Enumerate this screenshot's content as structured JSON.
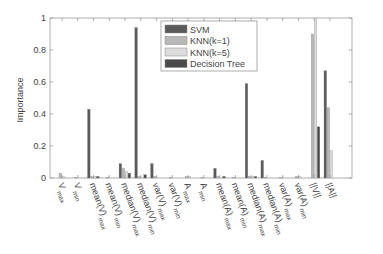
{
  "chart_data": {
    "type": "bar",
    "title": "",
    "xlabel": "",
    "ylabel": "Importance",
    "ylim": [
      0,
      1
    ],
    "yticks": [
      "0",
      "0.2",
      "0.4",
      "0.6",
      "0.8",
      "1"
    ],
    "grid": false,
    "legend_position": "upper right (inside)",
    "categories": [
      {
        "base": "V",
        "sub": "max"
      },
      {
        "base": "V",
        "sub": "min"
      },
      {
        "base": "mean(V)",
        "sub": "max"
      },
      {
        "base": "mean(V)",
        "sub": "min"
      },
      {
        "base": "median(V)",
        "sub": "max"
      },
      {
        "base": "median(V)",
        "sub": "min"
      },
      {
        "base": "var(V)",
        "sub": "max"
      },
      {
        "base": "var(V)",
        "sub": "min"
      },
      {
        "base": "A",
        "sub": "max"
      },
      {
        "base": "A",
        "sub": "min"
      },
      {
        "base": "mean(A)",
        "sub": "max"
      },
      {
        "base": "mean(A)",
        "sub": "min"
      },
      {
        "base": "median(A)",
        "sub": "max"
      },
      {
        "base": "median(A)",
        "sub": "min"
      },
      {
        "base": "var(A)",
        "sub": "max"
      },
      {
        "base": "var(A)",
        "sub": "min"
      },
      {
        "base": "||V||",
        "sub": ""
      },
      {
        "base": "||A||",
        "sub": ""
      }
    ],
    "series": [
      {
        "name": "SVM",
        "color": "#5a5a5a",
        "values": [
          0,
          0,
          0.43,
          0,
          0.09,
          0.94,
          0.09,
          0,
          0,
          0,
          0.06,
          0,
          0.59,
          0.11,
          0,
          0,
          0,
          0.67
        ]
      },
      {
        "name": "KNN(k=1)",
        "color": "#b8b8b8",
        "values": [
          0.03,
          0.005,
          0.01,
          0.005,
          0.06,
          0.01,
          0.01,
          0.005,
          0.01,
          0.005,
          0.01,
          0.005,
          0.01,
          0.005,
          0.005,
          0.01,
          0.9,
          0.44
        ]
      },
      {
        "name": "KNN(k=5)",
        "color": "#dcdcdc",
        "values": [
          0.01,
          0,
          0.01,
          0,
          0.04,
          0,
          0,
          0,
          0.01,
          0,
          0,
          0,
          0.01,
          0,
          0,
          0.01,
          1.0,
          0.17
        ]
      },
      {
        "name": "Decision Tree",
        "color": "#4a4a4a",
        "values": [
          0,
          0,
          0.01,
          0,
          0.03,
          0.02,
          0,
          0,
          0,
          0,
          0.01,
          0,
          0.01,
          0,
          0,
          0,
          0.32,
          0
        ]
      }
    ]
  },
  "legend": {
    "items": [
      "SVM",
      "KNN(k=1)",
      "KNN(k=5)",
      "Decision Tree"
    ]
  },
  "axes": {
    "ylabel": "Importance"
  }
}
